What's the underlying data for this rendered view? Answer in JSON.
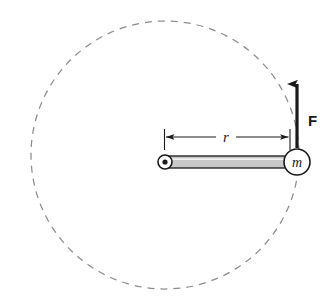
{
  "figure": {
    "background_color": "#ffffff",
    "ink_color": "#1a1a1a",
    "rod_fill_color": "#c8c8c8",
    "dash_color": "#8c8c8c"
  },
  "labels": {
    "radius": "r",
    "mass": "m",
    "force": "F"
  },
  "geometry": {
    "circle_center_x": 165,
    "circle_center_y": 155,
    "circle_radius": 134,
    "pivot_x": 165,
    "pivot_y": 162,
    "pivot_outer_radius": 7,
    "pivot_dot_radius": 2.6,
    "mass_x": 297,
    "mass_y": 162,
    "mass_radius": 13,
    "rod_left_x": 168,
    "rod_right_x": 287,
    "rod_top_y": 156,
    "rod_bottom_y": 168,
    "dimension_line_y": 137,
    "dimension_left_x": 164,
    "dimension_right_x": 290,
    "force_arrow_x": 297,
    "force_arrow_tail_y": 148,
    "force_arrow_tip_y": 76,
    "force_label_x": 308,
    "force_label_y": 126,
    "radius_label_x": 226,
    "radius_label_y": 134
  },
  "elements": {
    "path_circle_name": "circular-path",
    "pivot_name": "pivot-bearing",
    "rod_name": "rigid-rod",
    "mass_name": "point-mass",
    "force_name": "force-vector",
    "dimension_name": "radius-dimension"
  }
}
